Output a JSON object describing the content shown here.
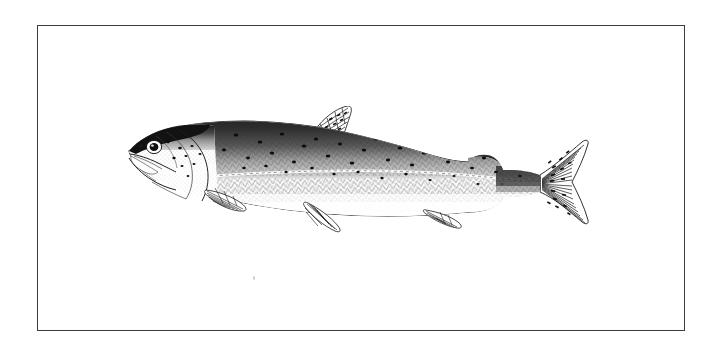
{
  "page": {
    "background_color": "#ffffff",
    "caption": ""
  },
  "frame": {
    "name": "illustration-border",
    "stroke_color": "#3b3b41",
    "stroke_width_px": 1.4,
    "x": 37,
    "y": 25,
    "width": 648,
    "height": 306
  },
  "illustration": {
    "title": "",
    "subject": "salmon",
    "medium": "pen-and-ink line engraving",
    "orientation": "left-facing lateral view",
    "ink_color": "#1c1c1c",
    "paper_color": "#ffffff",
    "bounds": {
      "x": 95,
      "y": 105,
      "width": 500,
      "height": 150
    },
    "parts": [
      {
        "name": "head",
        "label": "head"
      },
      {
        "name": "snout",
        "label": "snout"
      },
      {
        "name": "mouth",
        "label": "open mouth"
      },
      {
        "name": "eye",
        "label": "eye"
      },
      {
        "name": "gill-cover",
        "label": "operculum"
      },
      {
        "name": "dorsal-fin",
        "label": "dorsal fin"
      },
      {
        "name": "adipose-fin",
        "label": "adipose fin"
      },
      {
        "name": "pectoral-fin",
        "label": "pectoral fin"
      },
      {
        "name": "pelvic-fin",
        "label": "pelvic fin"
      },
      {
        "name": "anal-fin",
        "label": "anal fin"
      },
      {
        "name": "caudal-fin",
        "label": "caudal fin"
      },
      {
        "name": "lateral-line",
        "label": "lateral line"
      },
      {
        "name": "scales",
        "label": "scale texture"
      },
      {
        "name": "spots",
        "label": "dark spots"
      }
    ]
  }
}
